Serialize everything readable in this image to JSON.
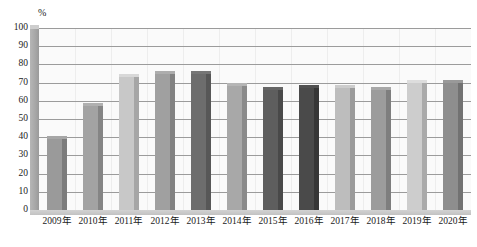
{
  "chart_data": {
    "type": "bar",
    "title": "",
    "subtitle": "",
    "xlabel": "",
    "ylabel": "",
    "unit_label": "%",
    "categories": [
      "2009年",
      "2010年",
      "2011年",
      "2012年",
      "2013年",
      "2014年",
      "2015年",
      "2016年",
      "2017年",
      "2018年",
      "2019年",
      "2020年"
    ],
    "values": [
      39,
      57,
      73,
      75,
      75,
      68,
      66,
      67,
      67,
      66,
      70,
      70
    ],
    "series": [
      {
        "name": "",
        "values": [
          39,
          57,
          73,
          75,
          75,
          68,
          66,
          67,
          67,
          66,
          70,
          70
        ]
      }
    ],
    "ylim": [
      0,
      100
    ],
    "ytick_step": 10,
    "yticks": [
      100,
      90,
      80,
      70,
      60,
      50,
      40,
      30,
      20,
      10,
      0
    ],
    "ytick_labels": [
      "100",
      "90",
      "80",
      "70",
      "60",
      "50",
      "40",
      "30",
      "20",
      "10",
      "0"
    ],
    "grid": true,
    "grid_axis": "y",
    "legend": false,
    "legend_position": "none",
    "bar_colors": [
      "#9a9a9a",
      "#a3a3a3",
      "#c8c8c8",
      "#a0a0a0",
      "#6d6d6d",
      "#a8a8a8",
      "#5e5e5e",
      "#4a4a4a",
      "#bdbdbd",
      "#9c9c9c",
      "#cdcdcd",
      "#8e8e8e"
    ],
    "bar_side_colors": [
      "#7c7c7c",
      "#858585",
      "#a6a6a6",
      "#828282",
      "#575757",
      "#8a8a8a",
      "#494949",
      "#363636",
      "#9b9b9b",
      "#7e7e7e",
      "#aaaaaa",
      "#727272"
    ],
    "axis_color": "#8a8a8a",
    "grid_color": "#9b9b9b",
    "plot_background": "#fafafa",
    "wall_color": "#a8a8a8"
  }
}
